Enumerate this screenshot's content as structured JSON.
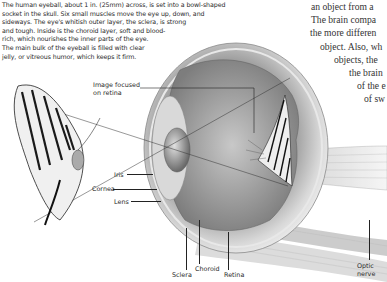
{
  "intro_text": "The human eyeball, about 1 in. (25mm) across, is set into a bowl-shaped socket in the skull. Six small muscles move the eye up, down, and sideways. The eye's whitish outer layer, the sclera, is strong and tough. Inside is the choroid layer, soft and blood-rich, which nourishes the inner parts of the eye. The main bulk of the eyeball is filled with clear jelly, or vitreous humor, which keeps it firm.",
  "intro_lines": [
    "The human eyeball, about 1 in. (25mm) across, is set into a bowl-shaped",
    "socket in the skull. Six small muscles move the eye up, down, and",
    "sideways. The eye's whitish outer layer, the sclera, is strong",
    "and tough. Inside is the choroid layer, soft and blood-",
    "rich, which nourishes the inner parts of the eye.",
    "The main bulk of the eyeball is filled with clear",
    "jelly, or vitreous humor, which keeps it firm."
  ],
  "side_text_lines": [
    "an object from a",
    "The brain compa",
    "the more differen",
    "object. Also, wh",
    "objects, the",
    "the brain",
    "of the e",
    "of sw"
  ],
  "labels": {
    "image_focused": [
      "Image focused",
      "on retina"
    ],
    "iris": "Iris",
    "cornea": "Cornea",
    "lens": "Lens",
    "sclera": "Sclera",
    "choroid": "Choroid",
    "retina": "Retina",
    "optic_nerve": [
      "Optic",
      "nerve"
    ]
  }
}
